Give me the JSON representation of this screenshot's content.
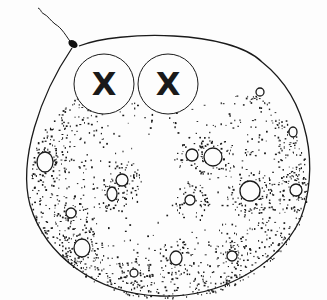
{
  "figure": {
    "title": "",
    "colors": {
      "background": "#fdfdfd",
      "ink": "#1a1a1a"
    },
    "cell_body": {
      "cx": 168,
      "cy": 183,
      "rx": 140,
      "ry": 116
    },
    "nuclei": [
      {
        "cx": 104,
        "cy": 84,
        "r": 30,
        "mark": "X"
      },
      {
        "cx": 168,
        "cy": 84,
        "r": 30,
        "mark": "X"
      }
    ],
    "flagellum": {
      "base": [
        72,
        44
      ]
    },
    "vacuoles": [
      {
        "cx": 45,
        "cy": 162,
        "rx": 8,
        "ry": 10
      },
      {
        "cx": 122,
        "cy": 180,
        "rx": 6,
        "ry": 6
      },
      {
        "cx": 112,
        "cy": 194,
        "rx": 5,
        "ry": 7
      },
      {
        "cx": 71,
        "cy": 213,
        "rx": 5,
        "ry": 5
      },
      {
        "cx": 82,
        "cy": 248,
        "rx": 8,
        "ry": 9
      },
      {
        "cx": 134,
        "cy": 273,
        "rx": 4,
        "ry": 4
      },
      {
        "cx": 213,
        "cy": 157,
        "rx": 9,
        "ry": 9
      },
      {
        "cx": 192,
        "cy": 155,
        "rx": 6,
        "ry": 6
      },
      {
        "cx": 190,
        "cy": 200,
        "rx": 5,
        "ry": 5
      },
      {
        "cx": 250,
        "cy": 191,
        "rx": 10,
        "ry": 10
      },
      {
        "cx": 296,
        "cy": 190,
        "rx": 6,
        "ry": 6
      },
      {
        "cx": 176,
        "cy": 258,
        "rx": 6,
        "ry": 7
      },
      {
        "cx": 232,
        "cy": 256,
        "rx": 5,
        "ry": 5
      },
      {
        "cx": 260,
        "cy": 92,
        "rx": 4,
        "ry": 4
      },
      {
        "cx": 293,
        "cy": 132,
        "rx": 4,
        "ry": 5
      }
    ]
  }
}
